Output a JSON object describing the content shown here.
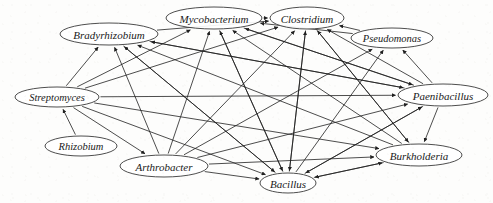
{
  "figure": {
    "width": 493,
    "height": 203,
    "background_color": "#fdfdfc",
    "node_stroke_color": "#3a3a3a",
    "edge_color": "#1f1f1f",
    "label_color": "#1a1a1a"
  },
  "chart_data": {
    "type": "diagram",
    "graph_type": "directed-network",
    "title": "",
    "xlabel": "",
    "ylabel": "",
    "grid": false,
    "legend": "none",
    "node_shape": "ellipse",
    "edge_style": "straight-arrow",
    "node_count": 10,
    "edge_count": 41,
    "nodes": [
      {
        "id": "bradyrhizobium",
        "label": "Bradyrhizobium",
        "x": 109,
        "y": 34,
        "rx": 49,
        "ry": 11,
        "font_size": 11
      },
      {
        "id": "mycobacterium",
        "label": "Mycobacterium",
        "x": 214,
        "y": 18,
        "rx": 48,
        "ry": 11,
        "font_size": 11
      },
      {
        "id": "clostridium",
        "label": "Clostridium",
        "x": 307,
        "y": 18,
        "rx": 37,
        "ry": 11,
        "font_size": 11
      },
      {
        "id": "pseudomonas",
        "label": "Pseudomonas",
        "x": 392,
        "y": 38,
        "rx": 41,
        "ry": 10,
        "font_size": 10.5
      },
      {
        "id": "paenibacillus",
        "label": "Paenibacillus",
        "x": 443,
        "y": 95,
        "rx": 45,
        "ry": 11,
        "font_size": 11
      },
      {
        "id": "streptomyces",
        "label": "Streptomyces",
        "x": 57,
        "y": 97,
        "rx": 42,
        "ry": 10,
        "font_size": 10.5
      },
      {
        "id": "rhizobium",
        "label": "Rhizobium",
        "x": 81,
        "y": 146,
        "rx": 36,
        "ry": 10,
        "font_size": 10.5
      },
      {
        "id": "arthrobacter",
        "label": "Arthrobacter",
        "x": 164,
        "y": 166,
        "rx": 44,
        "ry": 11,
        "font_size": 11
      },
      {
        "id": "bacillus",
        "label": "Bacillus",
        "x": 288,
        "y": 183,
        "rx": 28,
        "ry": 10,
        "font_size": 11
      },
      {
        "id": "burkholderia",
        "label": "Burkholderia",
        "x": 419,
        "y": 155,
        "rx": 43,
        "ry": 11,
        "font_size": 11
      }
    ],
    "edges": [
      {
        "from": "streptomyces",
        "to": "bradyrhizobium"
      },
      {
        "from": "streptomyces",
        "to": "mycobacterium"
      },
      {
        "from": "streptomyces",
        "to": "clostridium"
      },
      {
        "from": "streptomyces",
        "to": "paenibacillus"
      },
      {
        "from": "streptomyces",
        "to": "burkholderia"
      },
      {
        "from": "streptomyces",
        "to": "bacillus"
      },
      {
        "from": "rhizobium",
        "to": "streptomyces"
      },
      {
        "from": "arthrobacter",
        "to": "bradyrhizobium"
      },
      {
        "from": "arthrobacter",
        "to": "mycobacterium"
      },
      {
        "from": "arthrobacter",
        "to": "clostridium"
      },
      {
        "from": "arthrobacter",
        "to": "bacillus"
      },
      {
        "from": "arthrobacter",
        "to": "burkholderia"
      },
      {
        "from": "arthrobacter",
        "to": "paenibacillus"
      },
      {
        "from": "bacillus",
        "to": "bradyrhizobium"
      },
      {
        "from": "bacillus",
        "to": "mycobacterium"
      },
      {
        "from": "bacillus",
        "to": "clostridium"
      },
      {
        "from": "bacillus",
        "to": "burkholderia"
      },
      {
        "from": "bacillus",
        "to": "paenibacillus"
      },
      {
        "from": "burkholderia",
        "to": "bradyrhizobium"
      },
      {
        "from": "burkholderia",
        "to": "mycobacterium"
      },
      {
        "from": "burkholderia",
        "to": "clostridium"
      },
      {
        "from": "burkholderia",
        "to": "bacillus"
      },
      {
        "from": "paenibacillus",
        "to": "bradyrhizobium"
      },
      {
        "from": "paenibacillus",
        "to": "mycobacterium"
      },
      {
        "from": "paenibacillus",
        "to": "clostridium"
      },
      {
        "from": "paenibacillus",
        "to": "pseudomonas"
      },
      {
        "from": "paenibacillus",
        "to": "burkholderia"
      },
      {
        "from": "paenibacillus",
        "to": "bacillus"
      },
      {
        "from": "pseudomonas",
        "to": "clostridium"
      },
      {
        "from": "pseudomonas",
        "to": "mycobacterium"
      },
      {
        "from": "bradyrhizobium",
        "to": "clostridium"
      },
      {
        "from": "bradyrhizobium",
        "to": "paenibacillus"
      },
      {
        "from": "mycobacterium",
        "to": "clostridium"
      },
      {
        "from": "mycobacterium",
        "to": "paenibacillus"
      },
      {
        "from": "clostridium",
        "to": "burkholderia"
      },
      {
        "from": "clostridium",
        "to": "bacillus"
      },
      {
        "from": "streptomyces",
        "to": "arthrobacter"
      },
      {
        "from": "arthrobacter",
        "to": "pseudomonas"
      },
      {
        "from": "bacillus",
        "to": "pseudomonas"
      },
      {
        "from": "mycobacterium",
        "to": "bacillus"
      },
      {
        "from": "bradyrhizobium",
        "to": "bacillus"
      }
    ]
  }
}
